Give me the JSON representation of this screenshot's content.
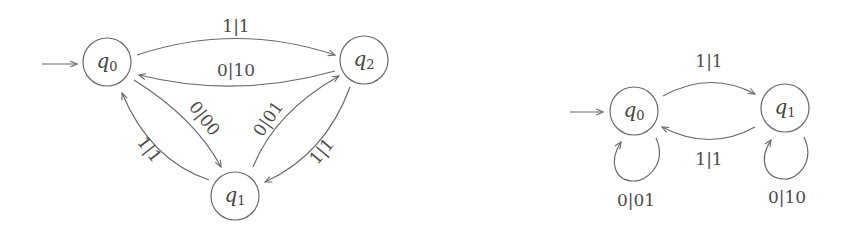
{
  "diagrams": [
    {
      "name": "three-state-transducer",
      "initial_state": "q0",
      "states": [
        {
          "id": "q0",
          "base": "q",
          "sub": "0"
        },
        {
          "id": "q1",
          "base": "q",
          "sub": "1"
        },
        {
          "id": "q2",
          "base": "q",
          "sub": "2"
        }
      ],
      "transitions": [
        {
          "from": "q0",
          "to": "q2",
          "label": "1|1"
        },
        {
          "from": "q2",
          "to": "q0",
          "label": "0|10"
        },
        {
          "from": "q0",
          "to": "q1",
          "label": "0|00"
        },
        {
          "from": "q1",
          "to": "q0",
          "label": "1|1"
        },
        {
          "from": "q1",
          "to": "q2",
          "label": "0|01"
        },
        {
          "from": "q2",
          "to": "q1",
          "label": "1|1"
        }
      ]
    },
    {
      "name": "two-state-transducer",
      "initial_state": "q0",
      "states": [
        {
          "id": "q0",
          "base": "q",
          "sub": "0"
        },
        {
          "id": "q1",
          "base": "q",
          "sub": "1"
        }
      ],
      "transitions": [
        {
          "from": "q0",
          "to": "q1",
          "label": "1|1"
        },
        {
          "from": "q1",
          "to": "q0",
          "label": "1|1"
        },
        {
          "from": "q0",
          "to": "q0",
          "label": "0|01"
        },
        {
          "from": "q1",
          "to": "q1",
          "label": "0|10"
        }
      ]
    }
  ]
}
